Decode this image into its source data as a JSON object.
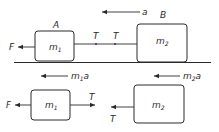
{
  "diagram": {
    "top": {
      "acceleration_label": "a",
      "block_a": {
        "name_label": "A",
        "mass_label": "m",
        "mass_sub": "1"
      },
      "block_b": {
        "name_label": "B",
        "mass_label": "m",
        "mass_sub": "2"
      },
      "force_label": "F",
      "tension_left_label": "T",
      "tension_right_label": "T"
    },
    "bottom": {
      "m1_accel_label": "m",
      "m1_accel_sub": "1",
      "m1_accel_a": "a",
      "m2_accel_label": "m",
      "m2_accel_sub": "2",
      "m2_accel_a": "a",
      "block_1": {
        "mass_label": "m",
        "mass_sub": "1"
      },
      "block_2": {
        "mass_label": "m",
        "mass_sub": "2"
      },
      "force_label": "F",
      "tension_1_label": "T",
      "tension_2_label": "T"
    },
    "colors": {
      "stroke": "#2a2a2a",
      "background": "#ffffff"
    }
  }
}
